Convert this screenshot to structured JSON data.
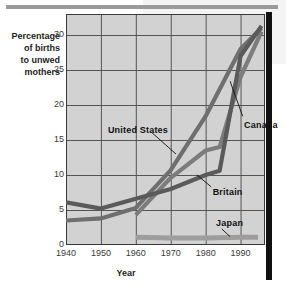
{
  "figure": {
    "background_color": "#ffffff",
    "plot_background_color": "#d2d2d2",
    "accent_bar_color": "#111111",
    "grid_color": "#555555"
  },
  "axis_titles": {
    "y_line1": "Percentage",
    "y_line2": "of births",
    "y_line3": "to unwed",
    "y_line4": "mothers",
    "x": "Year"
  },
  "series_labels": {
    "united_states": "United States",
    "canada": "Canada",
    "britain": "Britain",
    "japan": "Japan"
  },
  "chart_data": {
    "type": "line",
    "title": "Percentage of births to unwed mothers",
    "xlabel": "Year",
    "ylabel": "Percentage of births to unwed mothers",
    "xlim": [
      1940,
      1997
    ],
    "ylim": [
      0,
      33
    ],
    "xticks": [
      1940,
      1950,
      1960,
      1970,
      1980,
      1990
    ],
    "yticks": [
      0,
      5,
      10,
      15,
      20,
      25,
      30
    ],
    "xtick_labels": [
      "1940",
      "1950",
      "1960",
      "1970",
      "1980",
      "1990"
    ],
    "ytick_labels": [
      "0",
      "5",
      "10",
      "15",
      "20",
      "25",
      "30"
    ],
    "grid": true,
    "legend": "inline-annotations",
    "series": [
      {
        "name": "United States",
        "color": "#6f6f6f",
        "x": [
          1940,
          1950,
          1960,
          1970,
          1980,
          1990,
          1996
        ],
        "values": [
          3.5,
          3.8,
          5.3,
          10.7,
          18.4,
          28.0,
          31.0
        ]
      },
      {
        "name": "Canada",
        "color": "#7c7c7c",
        "x": [
          1960,
          1970,
          1980,
          1984,
          1990,
          1996
        ],
        "values": [
          4.3,
          9.6,
          13.5,
          14.0,
          24.0,
          30.5
        ]
      },
      {
        "name": "Britain",
        "color": "#5a5a5a",
        "x": [
          1940,
          1950,
          1960,
          1970,
          1980,
          1984,
          1990,
          1996
        ],
        "values": [
          6.1,
          5.2,
          6.6,
          8.0,
          10.0,
          10.6,
          27.0,
          31.3
        ]
      },
      {
        "name": "Japan",
        "color": "#9d9d9d",
        "x": [
          1960,
          1970,
          1980,
          1990,
          1995
        ],
        "values": [
          1.1,
          1.0,
          1.0,
          1.1,
          1.1
        ]
      }
    ],
    "annotations": [
      {
        "text": "United States",
        "x": 1952,
        "y": 16.5
      },
      {
        "text": "Canada",
        "x": 1991,
        "y": 17.2
      },
      {
        "text": "Britain",
        "x": 1982,
        "y": 7.6
      },
      {
        "text": "Japan",
        "x": 1983,
        "y": 3.1
      }
    ]
  }
}
